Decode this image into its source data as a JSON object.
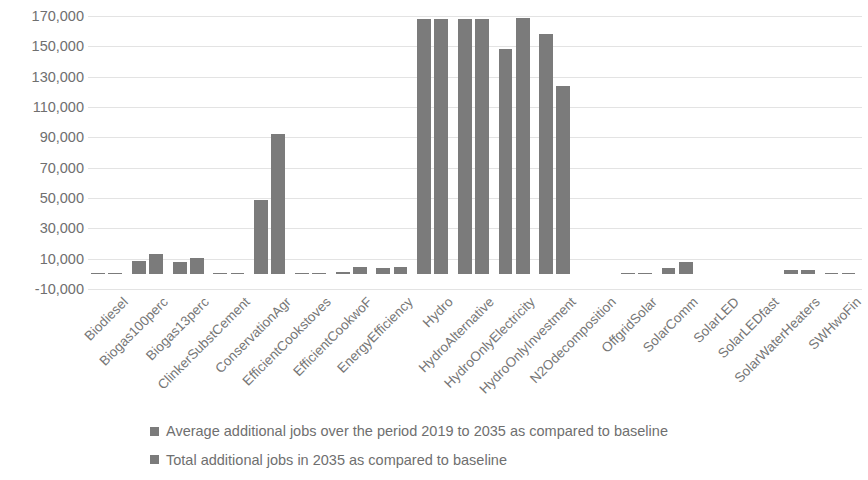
{
  "chart_data": {
    "type": "bar",
    "title": "",
    "xlabel": "",
    "ylabel": "",
    "ylim": [
      -10000,
      170000
    ],
    "ytick_step": 20000,
    "grid": true,
    "legend_position": "bottom",
    "bar_color": "#7b7b7b",
    "ytick_labels": [
      "170,000",
      "150,000",
      "130,000",
      "110,000",
      "90,000",
      "70,000",
      "50,000",
      "30,000",
      "10,000",
      "-10,000"
    ],
    "ytick_values": [
      170000,
      150000,
      130000,
      110000,
      90000,
      70000,
      50000,
      30000,
      10000,
      -10000
    ],
    "categories": [
      "Biodiesel",
      "Biogas100perc",
      "Biogas13perc",
      "ClinkerSubstCement",
      "ConservationAgr",
      "EfficientCookstoves",
      "EfficientCookwoF",
      "EnergyEfficiency",
      "Hydro",
      "HydroAlternative",
      "HydroOnlyElectricity",
      "HydroOnlyInvestment",
      "N2Odecomposition",
      "OffgridSolar",
      "SolarComm",
      "SolarLED",
      "SolarLEDfast",
      "SolarWaterHeaters",
      "SWHwoFin"
    ],
    "series": [
      {
        "name": "Average additional jobs over the period 2019 to 2035 as compared to baseline",
        "values": [
          700,
          8500,
          7800,
          200,
          49000,
          400,
          1500,
          4000,
          168000,
          168000,
          148000,
          158000,
          0,
          700,
          4000,
          0,
          0,
          2400,
          200
        ]
      },
      {
        "name": "Total additional jobs in 2035 as compared to baseline",
        "values": [
          800,
          13000,
          10200,
          200,
          92000,
          600,
          4600,
          4700,
          168000,
          168000,
          168500,
          124000,
          0,
          800,
          7500,
          0,
          0,
          2500,
          200
        ]
      }
    ]
  },
  "legend": {
    "items": [
      "Average additional jobs over the period 2019 to 2035 as compared to baseline",
      "Total additional jobs in 2035 as compared to baseline"
    ]
  }
}
